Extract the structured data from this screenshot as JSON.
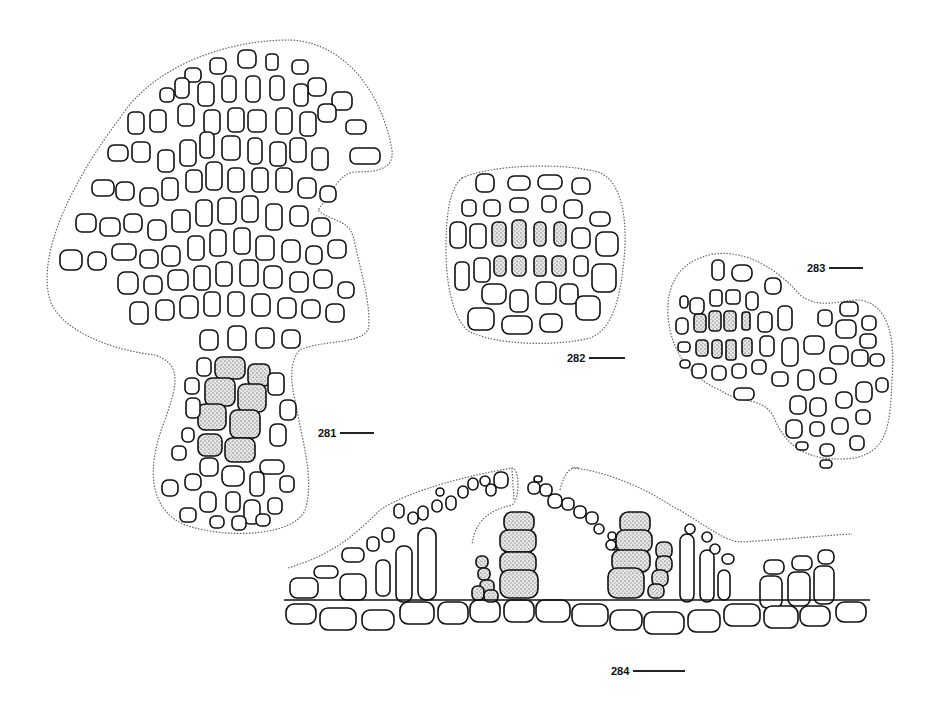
{
  "plate": {
    "figures": [
      {
        "id": "281",
        "label": "281",
        "description": "Cross section, mushroom-shaped thallus with radiating cell rows and stippled central medullary cells",
        "scale_bar_px": 34
      },
      {
        "id": "282",
        "label": "282",
        "description": "Rounded cross section with two rows of stippled central cells",
        "scale_bar_px": 36
      },
      {
        "id": "283",
        "label": "283",
        "description": "Lobed cross section with two rows of stippled cells on left",
        "scale_bar_px": 34
      },
      {
        "id": "284",
        "label": "284",
        "description": "Longitudinal section of crust showing conceptacle with stippled spore chains",
        "scale_bar_px": 52
      }
    ]
  }
}
